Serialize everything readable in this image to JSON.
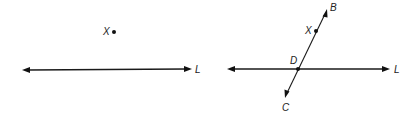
{
  "figures": [
    {
      "id": "before",
      "line": {
        "name": "L",
        "label": "L",
        "type": "line (bidirectional arrows)"
      },
      "points": [
        {
          "name": "X",
          "label": "X",
          "relation": "not on line L"
        }
      ]
    },
    {
      "id": "after",
      "line": {
        "name": "L",
        "label": "L",
        "type": "line (bidirectional arrows)"
      },
      "transversal": {
        "name": "BC",
        "label_end_top": "B",
        "label_end_bottom": "C",
        "type": "line through X and D"
      },
      "points": [
        {
          "name": "X",
          "label": "X",
          "relation": "on line BC"
        },
        {
          "name": "D",
          "label": "D",
          "relation": "intersection of line L and line BC"
        }
      ]
    }
  ],
  "colors": {
    "ink": "#1a1a1a",
    "background": "#ffffff"
  }
}
